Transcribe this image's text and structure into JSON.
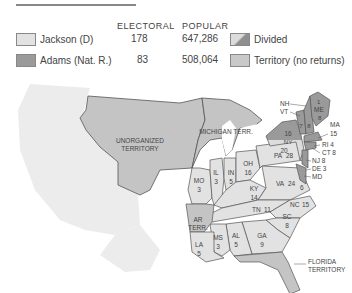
{
  "legend": {
    "headers": {
      "electoral": "ELECTORAL",
      "popular": "POPULAR"
    },
    "candidates": [
      {
        "name": "Jackson (D)",
        "electoral": "178",
        "popular": "647,286",
        "color": "#e2e2e2"
      },
      {
        "name": "Adams (Nat. R.)",
        "electoral": "83",
        "popular": "508,064",
        "color": "#9a9a9a"
      }
    ],
    "other": [
      {
        "name": "Divided",
        "color": "divided"
      },
      {
        "name": "Territory (no returns)",
        "color": "#c9c9c9"
      }
    ]
  },
  "map": {
    "territories": {
      "unorganized_1": "UNORGANIZED",
      "unorganized_2": "TERRITORY",
      "michigan": "MICHIGAN TERR.",
      "arkansas_1": "AR",
      "arkansas_2": "TERR.",
      "florida_1": "FLORIDA",
      "florida_2": "TERRITORY"
    },
    "states": [
      {
        "abbr": "IL",
        "votes": "3"
      },
      {
        "abbr": "IN",
        "votes": "5"
      },
      {
        "abbr": "OH",
        "votes": "16"
      },
      {
        "abbr": "PA",
        "votes": "28"
      },
      {
        "abbr": "MO",
        "votes": "3"
      },
      {
        "abbr": "KY",
        "votes": "14"
      },
      {
        "abbr": "VA",
        "votes": "24"
      },
      {
        "abbr": "TN",
        "votes": "11"
      },
      {
        "abbr": "NC",
        "votes": "15"
      },
      {
        "abbr": "SC",
        "votes": "8"
      },
      {
        "abbr": "GA",
        "votes": "9"
      },
      {
        "abbr": "AL",
        "votes": "5"
      },
      {
        "abbr": "MS",
        "votes": "3"
      },
      {
        "abbr": "LA",
        "votes": "5"
      },
      {
        "abbr": "NY",
        "votes": "16",
        "votes_adams": "20"
      },
      {
        "abbr": "ME",
        "votes": "1",
        "votes_adams": "8"
      },
      {
        "abbr": "VT",
        "votes": "7"
      },
      {
        "abbr": "NH",
        "votes": "8"
      }
    ],
    "callouts": {
      "nh": "NH",
      "vt": "VT",
      "ma": "MA",
      "ma_votes": "15",
      "ri": "RI  4",
      "ct": "CT  8",
      "nj": "NJ  8",
      "de": "DE  3",
      "md": "MD",
      "md_votes": "6"
    }
  }
}
